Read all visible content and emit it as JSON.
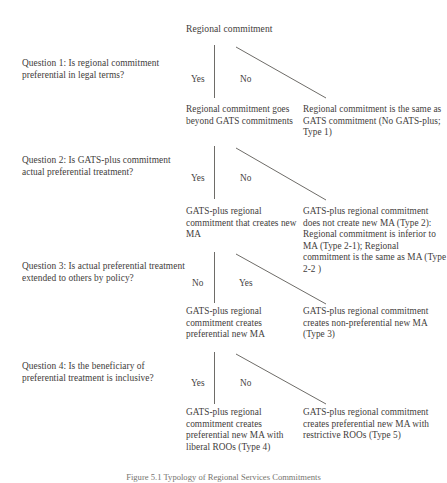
{
  "figure": {
    "root_label": "Regional commitment",
    "caption": "Figure 5.1  Typology of Regional Services Commitments"
  },
  "levels": [
    {
      "id": "level-1",
      "question": "Question 1: Is regional commitment preferential in legal terms?",
      "left_branch_label": "Yes",
      "right_branch_label": "No",
      "outcome_left": "Regional commitment goes beyond GATS commitments",
      "outcome_right": "Regional commitment is the same as GATS commitment (No GATS-plus; Type 1)"
    },
    {
      "id": "level-2",
      "question": "Question 2: Is GATS-plus commitment actual preferential treatment?",
      "left_branch_label": "Yes",
      "right_branch_label": "No",
      "outcome_left": "GATS-plus regional commitment that creates new MA",
      "outcome_right": "GATS-plus regional commitment does not create new MA (Type 2):  Regional commitment is inferior to MA (Type 2-1); Regional commitment is the same as MA (Type 2-2 )"
    },
    {
      "id": "level-3",
      "question": "Question 3: Is actual preferential treatment extended to others by policy?",
      "left_branch_label": "No",
      "right_branch_label": "Yes",
      "outcome_left": "GATS-plus regional commitment creates preferential new MA",
      "outcome_right": "GATS-plus regional commitment creates non-preferential new MA (Type 3)"
    },
    {
      "id": "level-4",
      "question": "Question 4: Is the beneficiary of preferential treatment is inclusive?",
      "left_branch_label": "Yes",
      "right_branch_label": "No",
      "outcome_left": "GATS-plus regional commitment creates preferential new MA with liberal ROOs (Type 4)",
      "outcome_right": "GATS-plus regional commitment creates preferential new MA with restrictive ROOs (Type 5)"
    }
  ],
  "colors": {
    "background": "#ffffff",
    "text": "#3f3d3b",
    "line": "#6e6c68"
  }
}
